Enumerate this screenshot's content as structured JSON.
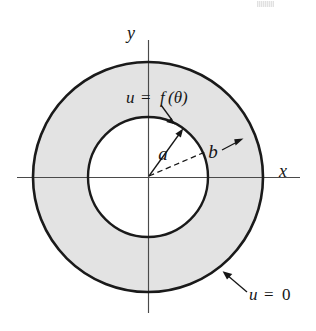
{
  "figure": {
    "kind": "annulus-diagram",
    "canvas": {
      "width": 316,
      "height": 331,
      "background": "#ffffff"
    },
    "center": {
      "x": 148,
      "y": 177
    },
    "colors": {
      "annulus_fill": "#e3e3e3",
      "inner_disk_fill": "#ffffff",
      "circle_stroke": "#1a1a1a",
      "axis_stroke": "#4a4a4a",
      "text": "#161616"
    },
    "circles": [
      {
        "name": "outer-circle",
        "radius_label": "b",
        "radius_px": 115,
        "stroke_width": 2.6,
        "boundary_condition": "u = 0"
      },
      {
        "name": "inner-circle",
        "radius_label": "a",
        "radius_px": 60,
        "stroke_width": 2.4,
        "boundary_condition": "u = f(θ)"
      }
    ],
    "axes": {
      "x_label": "x",
      "y_label": "y",
      "x_label_pos": {
        "x": 283,
        "y": 176
      },
      "y_label_pos": {
        "x": 131,
        "y": 38
      },
      "x_extent": {
        "x1": 17,
        "x2": 300,
        "y": 177
      },
      "y_extent": {
        "y1": 40,
        "y2": 313,
        "x": 148
      }
    },
    "annotations": [
      {
        "name": "inner-boundary-condition",
        "text_u": "u",
        "text_eq": "=",
        "text_f": "f",
        "text_theta": "(θ)",
        "full_text": "u = f(θ)",
        "pos": {
          "x": 154,
          "y": 101
        },
        "leader": "arrow pointing down-right to inner circle"
      },
      {
        "name": "inner-radius-label",
        "full_text": "a",
        "pos": {
          "x": 163,
          "y": 158
        },
        "leader": "solid arrow from origin to inner circle"
      },
      {
        "name": "outer-radius-label",
        "full_text": "b",
        "pos": {
          "x": 212,
          "y": 156
        },
        "leader": "dashed line from origin plus arrow to outer circle"
      },
      {
        "name": "outer-boundary-condition",
        "text_u": "u",
        "text_eq": "=",
        "text_zero": "0",
        "full_text": "u = 0",
        "pos": {
          "x": 250,
          "y": 300
        },
        "leader": "arrow pointing up-left to outer circle"
      }
    ]
  }
}
